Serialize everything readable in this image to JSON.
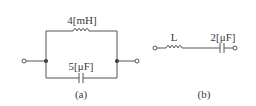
{
  "circuit_a": {
    "inductor_label": "4[mH]",
    "capacitor_label": "5[μF]",
    "caption": "(a)"
  },
  "circuit_b": {
    "inductor_label": "L",
    "capacitor_label": "2[μF]",
    "caption": "(b)"
  },
  "colors": {
    "line": "#555555",
    "text": "#3a3a3a",
    "background": "#ffffff"
  }
}
